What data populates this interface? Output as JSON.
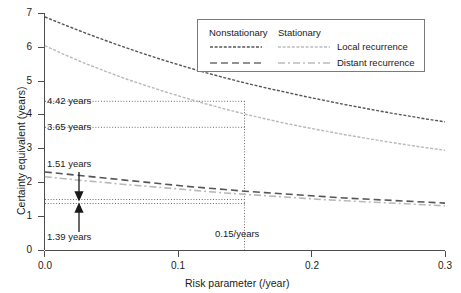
{
  "chart_data": {
    "type": "line",
    "title": "",
    "xlabel": "Risk parameter (/year)",
    "ylabel": "Certainty equivalent (years)",
    "xlim": [
      0.0,
      0.3
    ],
    "ylim": [
      0,
      7
    ],
    "xticks": [
      "0.0",
      "0.1",
      "0.2",
      "0.3"
    ],
    "xtick_values": [
      0.0,
      0.1,
      0.2,
      0.3
    ],
    "yticks": [
      "0",
      "1",
      "2",
      "3",
      "4",
      "5",
      "6",
      "7"
    ],
    "ytick_values": [
      0,
      1,
      2,
      3,
      4,
      5,
      6,
      7
    ],
    "grid": false,
    "legend_position": "top-right",
    "legend": {
      "col_headers": [
        "Nonstationary",
        "Stationary"
      ],
      "row_labels": [
        "Local recurrence",
        "Distant recurrence"
      ]
    },
    "series": [
      {
        "name": "Nonstationary local recurrence",
        "style": "dotted",
        "color": "#555555",
        "x": [
          0.0,
          0.015,
          0.03,
          0.045,
          0.06,
          0.075,
          0.09,
          0.105,
          0.12,
          0.135,
          0.15,
          0.165,
          0.18,
          0.195,
          0.21,
          0.225,
          0.24,
          0.255,
          0.27,
          0.285,
          0.3
        ],
        "y": [
          6.9,
          6.66,
          6.43,
          6.21,
          6.0,
          5.8,
          5.61,
          5.43,
          5.26,
          5.1,
          4.95,
          4.81,
          4.68,
          4.55,
          4.43,
          4.31,
          4.2,
          4.09,
          3.99,
          3.89,
          3.8
        ]
      },
      {
        "name": "Stationary local recurrence",
        "style": "dotted",
        "color": "#b9b9b9",
        "x": [
          0.0,
          0.015,
          0.03,
          0.045,
          0.06,
          0.075,
          0.09,
          0.105,
          0.12,
          0.135,
          0.15,
          0.165,
          0.18,
          0.195,
          0.21,
          0.225,
          0.24,
          0.255,
          0.27,
          0.285,
          0.3
        ],
        "y": [
          6.05,
          5.78,
          5.53,
          5.3,
          5.08,
          4.88,
          4.69,
          4.51,
          4.34,
          4.18,
          4.03,
          3.89,
          3.76,
          3.64,
          3.53,
          3.42,
          3.32,
          3.22,
          3.13,
          3.04,
          2.96
        ]
      },
      {
        "name": "Nonstationary distant recurrence",
        "style": "dashed",
        "color": "#555555",
        "x": [
          0.0,
          0.015,
          0.03,
          0.045,
          0.06,
          0.075,
          0.09,
          0.105,
          0.12,
          0.135,
          0.15,
          0.165,
          0.18,
          0.195,
          0.21,
          0.225,
          0.24,
          0.255,
          0.27,
          0.285,
          0.3
        ],
        "y": [
          2.32,
          2.26,
          2.2,
          2.14,
          2.08,
          2.02,
          1.96,
          1.9,
          1.85,
          1.8,
          1.75,
          1.71,
          1.67,
          1.63,
          1.59,
          1.55,
          1.52,
          1.49,
          1.46,
          1.43,
          1.4
        ]
      },
      {
        "name": "Stationary distant recurrence",
        "style": "dashdot",
        "color": "#b9b9b9",
        "x": [
          0.0,
          0.015,
          0.03,
          0.045,
          0.06,
          0.075,
          0.09,
          0.105,
          0.12,
          0.135,
          0.15,
          0.165,
          0.18,
          0.195,
          0.21,
          0.225,
          0.24,
          0.255,
          0.27,
          0.285,
          0.3
        ],
        "y": [
          2.18,
          2.12,
          2.06,
          2.01,
          1.95,
          1.9,
          1.85,
          1.8,
          1.75,
          1.7,
          1.66,
          1.62,
          1.58,
          1.54,
          1.5,
          1.47,
          1.44,
          1.41,
          1.38,
          1.35,
          1.32
        ]
      }
    ],
    "annotations": [
      {
        "name": "ce-nonstationary-local",
        "text": "4.42 years",
        "value": 4.42,
        "type": "hline-label"
      },
      {
        "name": "ce-stationary-local",
        "text": "3.65 years",
        "value": 3.65,
        "type": "hline-label"
      },
      {
        "name": "ce-nonstationary-distant",
        "text": "1.51 years",
        "value": 1.51,
        "type": "arrow-label"
      },
      {
        "name": "ce-stationary-distant",
        "text": "1.39 years",
        "value": 1.39,
        "type": "arrow-label"
      },
      {
        "name": "risk-parameter-marker",
        "text": "0.15/years",
        "value": 0.15,
        "type": "vline-label"
      }
    ]
  }
}
